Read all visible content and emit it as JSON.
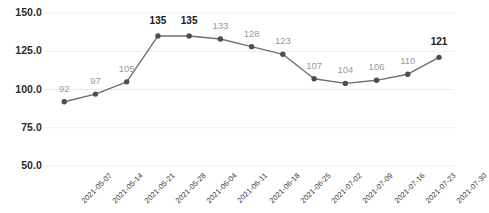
{
  "chart_data": {
    "type": "line",
    "title": "",
    "subtitle": "",
    "xlabel": "",
    "ylabel": "",
    "categories": [
      "2021-05-07",
      "2021-05-14",
      "2021-05-21",
      "2021-05-28",
      "2021-06-04",
      "2021-06-11",
      "2021-06-18",
      "2021-06-25",
      "2021-07-02",
      "2021-07-09",
      "2021-07-16",
      "2021-07-23",
      "2021-07-30"
    ],
    "values": [
      92,
      97,
      105,
      135,
      135,
      133,
      128,
      123,
      107,
      104,
      106,
      110,
      121
    ],
    "point_labels": [
      "92",
      "97",
      "105",
      "135",
      "135",
      "133",
      "128",
      "123",
      "107",
      "104",
      "106",
      "110",
      "121"
    ],
    "point_label_emphasis": [
      "normal",
      "normal",
      "normal",
      "bold",
      "bold",
      "normal",
      "normal",
      "normal",
      "normal",
      "normal",
      "normal",
      "normal",
      "bold"
    ],
    "ylim": [
      50,
      150
    ],
    "yticks": [
      50,
      75,
      100,
      125,
      150
    ],
    "ytick_labels": [
      "50.0",
      "75.0",
      "100.0",
      "125.0",
      "150.0"
    ],
    "grid": true,
    "grid_axis": "y",
    "legend": "none",
    "series": [
      {
        "name": "value",
        "values": [
          92,
          97,
          105,
          135,
          135,
          133,
          128,
          123,
          107,
          104,
          106,
          110,
          121
        ]
      }
    ],
    "colors": {
      "line": "#6f6f6f",
      "marker": "#4d4d4d",
      "grid": "#ececec",
      "tick_text": "#2b2b2b",
      "xtick_text": "#3a3a3a",
      "label_normal": "#9a9a9a",
      "label_bold": "#1b1b1b",
      "background": "#ffffff"
    }
  }
}
